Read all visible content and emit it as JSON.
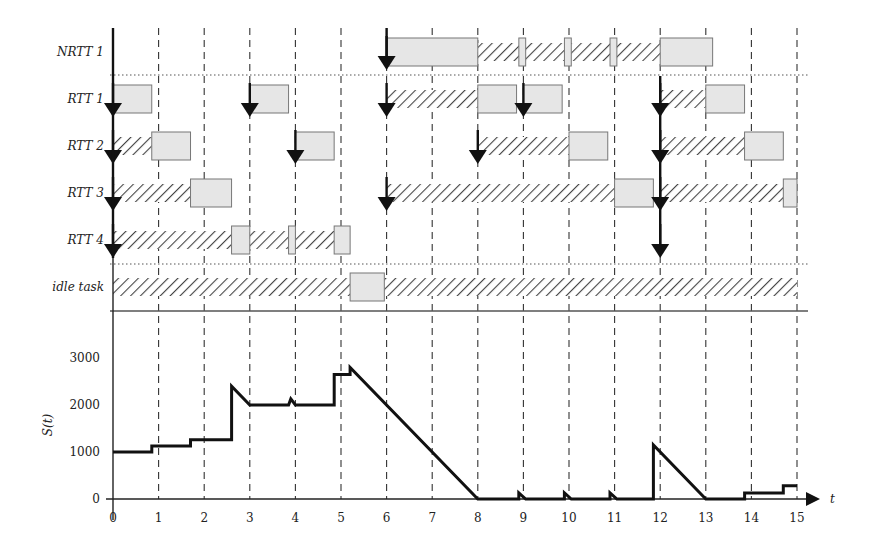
{
  "chart_data": [
    {
      "type": "gantt",
      "title": "",
      "xlabel": "t",
      "x_ticks": [
        0,
        1,
        2,
        3,
        4,
        5,
        6,
        7,
        8,
        9,
        10,
        11,
        12,
        13,
        14,
        15
      ],
      "grid": "vertical dashed lines at each integer t",
      "rows": [
        {
          "label": "NRTT 1",
          "releases": [
            6
          ],
          "executing": [
            [
              6,
              8
            ],
            [
              8.9,
              9.05
            ],
            [
              9.9,
              10.05
            ],
            [
              10.9,
              11.05
            ],
            [
              12,
              13.15
            ]
          ],
          "waiting": [
            [
              8,
              12
            ]
          ]
        },
        {
          "label": "RTT 1",
          "releases": [
            0,
            3,
            6,
            9,
            12
          ],
          "executing": [
            [
              0,
              0.85
            ],
            [
              3,
              3.85
            ],
            [
              8,
              8.85
            ],
            [
              9,
              9.85
            ],
            [
              13,
              13.85
            ]
          ],
          "waiting": [
            [
              6,
              8
            ],
            [
              12,
              13
            ]
          ]
        },
        {
          "label": "RTT 2",
          "releases": [
            0,
            4,
            8,
            12
          ],
          "executing": [
            [
              0.85,
              1.7
            ],
            [
              4,
              4.85
            ],
            [
              10,
              10.85
            ],
            [
              13.85,
              14.7
            ]
          ],
          "waiting": [
            [
              0,
              0.85
            ],
            [
              8,
              10
            ],
            [
              12,
              13.85
            ]
          ]
        },
        {
          "label": "RTT 3",
          "releases": [
            0,
            6,
            12
          ],
          "executing": [
            [
              1.7,
              2.6
            ],
            [
              11,
              11.85
            ],
            [
              14.7,
              15
            ]
          ],
          "waiting": [
            [
              0,
              1.7
            ],
            [
              6,
              11
            ],
            [
              12,
              14.7
            ]
          ]
        },
        {
          "label": "RTT 4",
          "releases": [
            0,
            12
          ],
          "executing": [
            [
              2.6,
              3
            ],
            [
              3.85,
              4
            ],
            [
              4.85,
              5.2
            ]
          ],
          "waiting": [
            [
              0,
              2.6
            ],
            [
              3,
              3.85
            ],
            [
              4,
              4.85
            ]
          ]
        },
        {
          "label": "idle task",
          "releases": [],
          "executing": [
            [
              5.2,
              5.95
            ]
          ],
          "waiting": [
            [
              0,
              5.2
            ],
            [
              5.95,
              15
            ]
          ]
        }
      ]
    },
    {
      "type": "line",
      "title": "",
      "xlabel": "t",
      "ylabel": "S(t)",
      "x_ticks": [
        0,
        1,
        2,
        3,
        4,
        5,
        6,
        7,
        8,
        9,
        10,
        11,
        12,
        13,
        14,
        15
      ],
      "y_ticks": [
        0,
        1000,
        2000,
        3000
      ],
      "xlim": [
        0,
        15
      ],
      "ylim": [
        0,
        3000
      ],
      "series": [
        {
          "name": "S(t)",
          "x": [
            0,
            0.85,
            0.85,
            1.7,
            1.7,
            2.6,
            2.6,
            3,
            3.85,
            3.9,
            4,
            4.85,
            4.85,
            5.2,
            5.2,
            8,
            8.9,
            8.9,
            9.05,
            9.9,
            9.9,
            10.05,
            10.9,
            10.9,
            11.05,
            11.85,
            11.85,
            13,
            13.85,
            13.85,
            14.7,
            14.7,
            15
          ],
          "values": [
            1000,
            1000,
            1130,
            1130,
            1260,
            1260,
            2400,
            2000,
            2000,
            2130,
            2000,
            2000,
            2650,
            2650,
            2800,
            0,
            0,
            130,
            0,
            0,
            130,
            0,
            0,
            130,
            0,
            0,
            1150,
            0,
            0,
            130,
            130,
            280,
            280
          ]
        }
      ]
    }
  ],
  "labels": {
    "rows": [
      "NRTT 1",
      "RTT 1",
      "RTT 2",
      "RTT 3",
      "RTT 4",
      "idle task"
    ],
    "ylabel": "S(t)",
    "xlabel": "t"
  }
}
